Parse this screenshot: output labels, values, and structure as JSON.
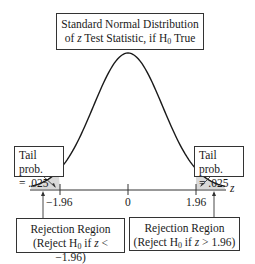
{
  "title": {
    "line1": "Standard Normal Distribution",
    "line2_prefix": "of ",
    "line2_var": "z",
    "line2_mid": " Test Statistic, if H",
    "line2_sub": "0",
    "line2_suffix": " True"
  },
  "tails": {
    "left": {
      "line1": "Tail prob.",
      "line2": "= .025"
    },
    "right": {
      "line1": "Tail prob.",
      "line2": "= .025"
    }
  },
  "axis": {
    "variable": "z",
    "ticks": [
      {
        "value": -1.96,
        "label": "−1.96"
      },
      {
        "value": 0,
        "label": "0"
      },
      {
        "value": 1.96,
        "label": "1.96"
      }
    ]
  },
  "rejection_regions": {
    "left": {
      "line1": "Rejection Region",
      "line2_prefix": "(Reject H",
      "line2_sub": "0",
      "line2_mid": " if ",
      "line2_var": "z",
      "line2_suffix": " < −1.96)"
    },
    "right": {
      "line1": "Rejection Region",
      "line2_prefix": "(Reject H",
      "line2_sub": "0",
      "line2_mid": " if ",
      "line2_var": "z",
      "line2_suffix": " > 1.96)"
    }
  },
  "colors": {
    "curve": "#1a1a1a",
    "tail_shade": "#d9d9d9",
    "box_border": "#333333"
  },
  "chart_data": {
    "type": "line",
    "title": "Standard Normal Distribution of z Test Statistic, if H0 True",
    "xlabel": "z",
    "ylabel": "",
    "x_ticks": [
      -1.96,
      0,
      1.96
    ],
    "x_tick_labels": [
      "−1.96",
      "0",
      "1.96"
    ],
    "xlim": [
      -2.8,
      2.8
    ],
    "distribution": "standard normal",
    "shaded_regions": [
      {
        "from": -2.8,
        "to": -1.96,
        "probability": 0.025,
        "label": "Tail prob. = .025"
      },
      {
        "from": 1.96,
        "to": 2.8,
        "probability": 0.025,
        "label": "Tail prob. = .025"
      }
    ],
    "annotations": [
      "Rejection Region (Reject H0 if z < −1.96)",
      "Rejection Region (Reject H0 if z > 1.96)"
    ],
    "grid": false
  }
}
